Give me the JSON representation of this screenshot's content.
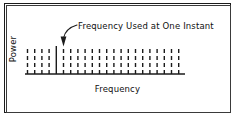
{
  "figure": {
    "background_color": "#ffffff",
    "line_color": "#1b1b1b",
    "frame": {
      "outer_color": "#1b1b1b",
      "inner_color": "#3a3a3a"
    }
  },
  "annotation": {
    "label": "Frequency Used at One Instant",
    "arrow_icon_name": "curved-arrow-icon",
    "points_to": "highlighted-frequency-line"
  },
  "axes": {
    "y_label": "Power",
    "x_label": "Frequency"
  },
  "chart_data": {
    "type": "bar",
    "title": "",
    "subtitle": "",
    "xlabel": "Frequency",
    "ylabel": "Power",
    "grid": false,
    "legend": null,
    "annotations": [
      {
        "text": "Frequency Used at One Instant",
        "target_index": 4,
        "arrow": "curved"
      }
    ],
    "axis": {
      "baseline_y_px": 74,
      "x_start_px": 25,
      "x_end_px": 185,
      "bar_top_y_px": 46
    },
    "style": {
      "channel_stroke": "dashed",
      "active_stroke": "solid",
      "dash_pattern": [
        4,
        3
      ],
      "stroke_width": 1.4,
      "spacing_px": 7.2
    },
    "categories": [
      "f1",
      "f2",
      "f3",
      "f4",
      "f5",
      "f6",
      "f7",
      "f8",
      "f9",
      "f10",
      "f11",
      "f12",
      "f13",
      "f14",
      "f15",
      "f16",
      "f17",
      "f18",
      "f19",
      "f20",
      "f21",
      "f22"
    ],
    "values": [
      1,
      1,
      1,
      1,
      1,
      1,
      1,
      1,
      1,
      1,
      1,
      1,
      1,
      1,
      1,
      1,
      1,
      1,
      1,
      1,
      1,
      1
    ],
    "active_index": 4,
    "ylim": [
      0,
      1.15
    ],
    "x_positions_px": [
      27.5,
      34.7,
      41.9,
      49.1,
      56.3,
      63.5,
      70.7,
      77.9,
      85.1,
      92.3,
      99.5,
      106.7,
      113.9,
      121.1,
      128.3,
      135.5,
      142.7,
      149.9,
      157.1,
      164.3,
      171.5,
      178.7
    ]
  }
}
